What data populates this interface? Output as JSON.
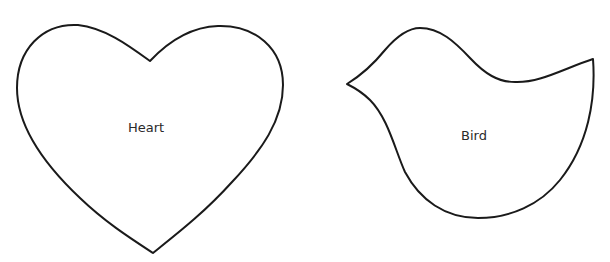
{
  "shapes": [
    {
      "name": "heart",
      "label": "Heart"
    },
    {
      "name": "bird",
      "label": "Bird"
    }
  ],
  "colors": {
    "stroke": "#1a1a1a",
    "fill": "#ffffff",
    "label": "#2a2a2a",
    "background": "#ffffff"
  }
}
